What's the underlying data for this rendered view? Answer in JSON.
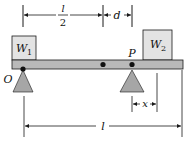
{
  "diagram": {
    "title": "",
    "colors": {
      "beam_fill": "#b9b9b9",
      "box_fill": "#e3e3e3",
      "support_fill": "#a6a6a6",
      "line": "#1a1a1a",
      "background": "#ffffff"
    },
    "weights": {
      "left": {
        "label": "W",
        "subscript": "1"
      },
      "right": {
        "label": "W",
        "subscript": "2"
      }
    },
    "points": {
      "origin": "O",
      "pivot": "P"
    },
    "dimensions": {
      "half_length_numerator": "l",
      "half_length_denominator": "2",
      "offset": "d",
      "pivot_distance": "x",
      "length": "l"
    }
  }
}
